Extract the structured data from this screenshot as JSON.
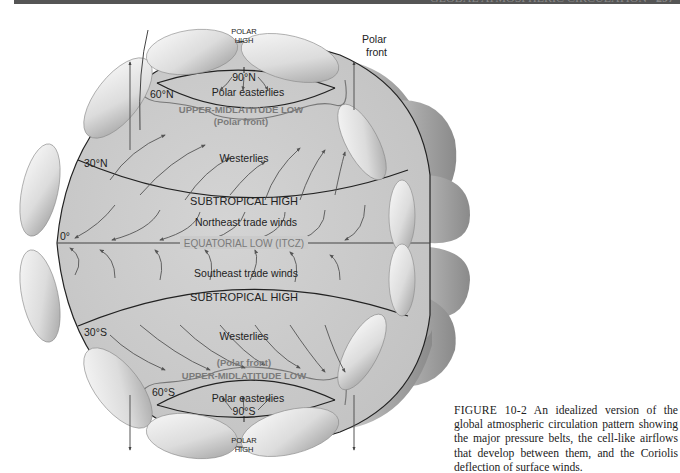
{
  "header": {
    "running_head": "GLOBAL ATMOSPHERIC CIRCULATION",
    "page_number": "297"
  },
  "diagram": {
    "title": "Global atmospheric circulation",
    "latitudes": {
      "n90": "90°N",
      "n60": "60°N",
      "n30": "30°N",
      "eq": "0°",
      "s30": "30°S",
      "s60": "60°S",
      "s90": "90°S"
    },
    "pressure_belts": {
      "polar_high_north_1": "POLAR",
      "polar_high_north_2": "HIGH",
      "upper_midlat_low_north": "UPPER-MIDLATITUDE LOW",
      "polar_front_north": "(Polar front)",
      "subtropical_high_north": "SUBTROPICAL HIGH",
      "equatorial_low": "EQUATORIAL LOW (ITCZ)",
      "subtropical_high_south": "SUBTROPICAL HIGH",
      "polar_front_south": "(Polar front)",
      "upper_midlat_low_south": "UPPER-MIDLATITUDE LOW",
      "polar_high_south_1": "POLAR",
      "polar_high_south_2": "HIGH"
    },
    "winds": {
      "polar_easterlies_north": "Polar easterlies",
      "westerlies_north": "Westerlies",
      "ne_trades": "Northeast trade winds",
      "se_trades": "Southeast trade winds",
      "westerlies_south": "Westerlies",
      "polar_easterlies_south": "Polar easterlies"
    },
    "callouts": {
      "polar_front_1": "Polar",
      "polar_front_2": "front"
    },
    "colors": {
      "globe_fill": "#cbcbcb",
      "cell_light": "#f2f2f2",
      "cell_dark": "#9a9a9a",
      "line": "#222222",
      "arrow": "#555555",
      "grey_label": "#7a7a7a"
    }
  },
  "caption": {
    "figure_label": "FIGURE 10-2",
    "text": " An idealized version of the global atmospheric circulation pattern showing the major pressure belts, the cell-like airflows that develop between them, and the Coriolis deflection of surface winds."
  }
}
